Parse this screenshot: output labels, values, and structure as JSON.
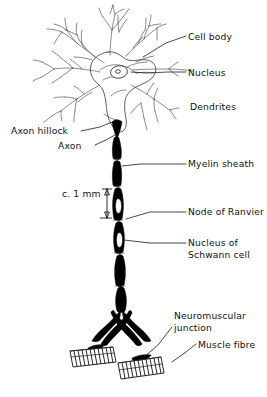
{
  "figure": {
    "background_color": "#ffffff",
    "ink_color": "#000000"
  },
  "labels": {
    "cell_body": "Cell body",
    "nucleus": "Nucleus",
    "dendrites": "Dendrites",
    "axon_hillock": "Axon hillock",
    "axon": "Axon",
    "myelin_sheath": "Myelin sheath",
    "scale": "c. 1 mm",
    "node_of_ranvier": "Node of Ranvier",
    "schwann_nucleus_line1": "Nucleus of",
    "schwann_nucleus_line2": "Schwann cell",
    "neuromuscular_line1": "Neuromuscular",
    "neuromuscular_line2": "junction",
    "muscle_fibre": "Muscle fibre"
  },
  "measurements": {
    "axon_segment_length": "c. 1 mm"
  },
  "parts": {
    "soma_name": "cell-body-soma",
    "nucleus_name": "nucleus-oval",
    "nucleolus_name": "nucleolus-dot",
    "dendrite_count": 7,
    "myelin_segment_count": 7,
    "muscle_fibre_count": 2
  }
}
